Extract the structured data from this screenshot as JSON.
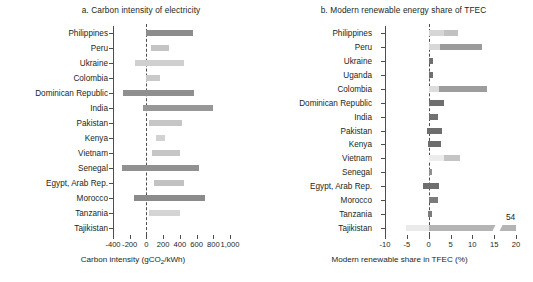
{
  "figure": {
    "background": "#ffffff",
    "text_color": "#231f20",
    "axis_color": "#4d4d4d"
  },
  "chart_data": [
    {
      "id": "panel-a",
      "type": "bar",
      "orientation": "horizontal",
      "bar_style": "range",
      "title": "a. Carbon intensity of electricity",
      "xlabel": "Carbon intensity (gCO2/kWh)",
      "xlabel_parts": {
        "pre": "Carbon intensity (gCO",
        "sub": "2",
        "post": "/kWh)"
      },
      "ylabel": "",
      "xlim": [
        -400,
        1000
      ],
      "xticks": [
        -400,
        -200,
        0,
        200,
        400,
        600,
        800,
        1000
      ],
      "xticklabels": [
        "-400",
        "-200",
        "0",
        "200",
        "400",
        "600",
        "800",
        "1,000"
      ],
      "zero_reference": 0,
      "grid": false,
      "legend": "none",
      "categories": [
        "Philippines",
        "Peru",
        "Ukraine",
        "Colombia",
        "Dominican Republic",
        "India",
        "Pakistan",
        "Kenya",
        "Vietnam",
        "Senegal",
        "Egypt, Arab Rep.",
        "Morocco",
        "Tanzania",
        "Tajikistan"
      ],
      "bars": [
        {
          "category": "Philippines",
          "start": 0,
          "end": 560,
          "color": "#8c8c8c"
        },
        {
          "category": "Peru",
          "start": 60,
          "end": 270,
          "color": "#c4c4c4"
        },
        {
          "category": "Ukraine",
          "start": -135,
          "end": 450,
          "color": "#cfcfcf"
        },
        {
          "category": "Colombia",
          "start": 0,
          "end": 165,
          "color": "#c9c9c9"
        },
        {
          "category": "Dominican Republic",
          "start": -280,
          "end": 575,
          "color": "#8f8f8f"
        },
        {
          "category": "India",
          "start": -45,
          "end": 800,
          "color": "#979797"
        },
        {
          "category": "Pakistan",
          "start": 25,
          "end": 425,
          "color": "#c6c6c6"
        },
        {
          "category": "Kenya",
          "start": 115,
          "end": 225,
          "color": "#d2d2d2"
        },
        {
          "category": "Vietnam",
          "start": 70,
          "end": 400,
          "color": "#c6c6c6"
        },
        {
          "category": "Senegal",
          "start": -295,
          "end": 630,
          "color": "#919191"
        },
        {
          "category": "Egypt, Arab Rep.",
          "start": 85,
          "end": 445,
          "color": "#c2c2c2"
        },
        {
          "category": "Morocco",
          "start": -145,
          "end": 705,
          "color": "#8b8b8b"
        },
        {
          "category": "Tanzania",
          "start": 35,
          "end": 400,
          "color": "#d4d4d4"
        },
        {
          "category": "Tajikistan",
          "start": 0,
          "end": 0,
          "color": "#d4d4d4"
        }
      ]
    },
    {
      "id": "panel-b",
      "type": "bar",
      "orientation": "horizontal",
      "bar_style": "range",
      "title": "b. Modern renewable energy share of TFEC",
      "xlabel": "Modern renewable share in TFEC (%)",
      "ylabel": "",
      "xlim": [
        -10,
        20
      ],
      "xticks": [
        -10,
        -5,
        0,
        5,
        10,
        15,
        20
      ],
      "xticklabels": [
        "-10",
        "-5",
        "0",
        "5",
        "10",
        "15",
        "20"
      ],
      "zero_reference": 0,
      "grid": false,
      "legend": "none",
      "categories": [
        "Philippines",
        "Peru",
        "Ukraine",
        "Uganda",
        "Colombia",
        "Dominican Republic",
        "India",
        "Pakistan",
        "Kenya",
        "Vietnam",
        "Senegal",
        "Egypt, Arab Rep.",
        "Morocco",
        "Tanzania",
        "Tajikistan"
      ],
      "bars": [
        {
          "category": "Philippines",
          "start": 0.0,
          "end": 6.8,
          "color": "#d6d6d6",
          "split": 3.4,
          "color2": "#c2c2c2"
        },
        {
          "category": "Peru",
          "start": 0.0,
          "end": 12.3,
          "color": "#d8d8d8",
          "split": 2.6,
          "color2": "#9b9b9b"
        },
        {
          "category": "Ukraine",
          "start": 0.0,
          "end": 1.0,
          "color": "#6f6f6f"
        },
        {
          "category": "Uganda",
          "start": 0.0,
          "end": 1.0,
          "color": "#6f6f6f"
        },
        {
          "category": "Colombia",
          "start": 0.0,
          "end": 13.3,
          "color": "#dcdcdc",
          "split": 2.4,
          "color2": "#9d9d9d"
        },
        {
          "category": "Dominican Republic",
          "start": 0.0,
          "end": 3.5,
          "color": "#6e6e6e"
        },
        {
          "category": "India",
          "start": 0.0,
          "end": 2.2,
          "color": "#707070"
        },
        {
          "category": "Pakistan",
          "start": -0.3,
          "end": 3.0,
          "color": "#6d6d6d"
        },
        {
          "category": "Kenya",
          "start": -0.2,
          "end": 2.9,
          "color": "#6d6d6d"
        },
        {
          "category": "Vietnam",
          "start": 0.0,
          "end": 7.1,
          "color": "#ececec",
          "split": 3.6,
          "color2": "#c4c4c4"
        },
        {
          "category": "Senegal",
          "start": 0.0,
          "end": 0.7,
          "color": "#8f8f8f"
        },
        {
          "category": "Egypt, Arab Rep.",
          "start": -1.4,
          "end": 2.4,
          "color": "#6e6e6e"
        },
        {
          "category": "Morocco",
          "start": 0.0,
          "end": 2.1,
          "color": "#7b7b7b"
        },
        {
          "category": "Tanzania",
          "start": -0.2,
          "end": 0.7,
          "color": "#7c7c7c"
        },
        {
          "category": "Tajikistan",
          "start": -5.2,
          "end": 20.0,
          "color": "#eaeaea",
          "split": 0.0,
          "color2": "#b4b4b4",
          "clipped": true,
          "value_label": "54"
        }
      ],
      "annotations": [
        {
          "text": "54",
          "category": "Tajikistan",
          "x": 17.7,
          "note": "value exceeds axis maximum"
        }
      ]
    }
  ]
}
